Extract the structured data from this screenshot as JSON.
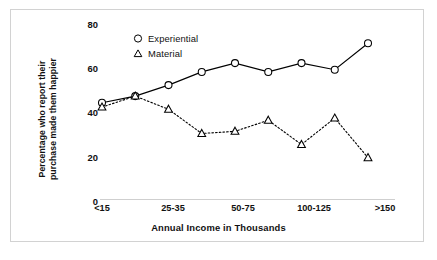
{
  "chart_data": {
    "type": "line",
    "title": "",
    "xlabel": "Annual Income in Thousands",
    "ylabel": "Percentage who report their purchase made them happier",
    "ylabel_lines": [
      "Percentage who report their",
      "purchase made them happier"
    ],
    "categories": [
      "<15",
      "15-25",
      "25-35",
      "35-50",
      "50-75",
      "75-100",
      "100-125",
      "125-150",
      ">150"
    ],
    "xtick_labels": [
      "<15",
      "",
      "25-35",
      "",
      "50-75",
      "",
      "100-125",
      "",
      ">150"
    ],
    "ytick_labels": [
      "0",
      "20",
      "40",
      "60",
      "80"
    ],
    "yticks": [
      0,
      20,
      40,
      60,
      80
    ],
    "ylim": [
      0,
      80
    ],
    "grid": false,
    "legend_position": "upper-left-inside",
    "series": [
      {
        "name": "Experiential",
        "marker": "circle-open",
        "linestyle": "solid",
        "color": "#000000",
        "values": [
          44,
          47,
          52,
          58,
          62,
          58,
          62,
          59,
          71
        ]
      },
      {
        "name": "Material",
        "marker": "triangle-open",
        "linestyle": "dotted",
        "color": "#000000",
        "values": [
          42,
          47,
          41,
          30,
          31,
          36,
          25,
          37,
          19
        ]
      }
    ]
  },
  "legend": {
    "items": [
      {
        "label": "Experiential",
        "marker": "circle-open"
      },
      {
        "label": "Material",
        "marker": "triangle-open"
      }
    ]
  },
  "colors": {
    "line": "#000000",
    "text": "#111111",
    "frame": "#d2d2d2",
    "background": "#ffffff",
    "baseline": "#cfcfcf"
  }
}
